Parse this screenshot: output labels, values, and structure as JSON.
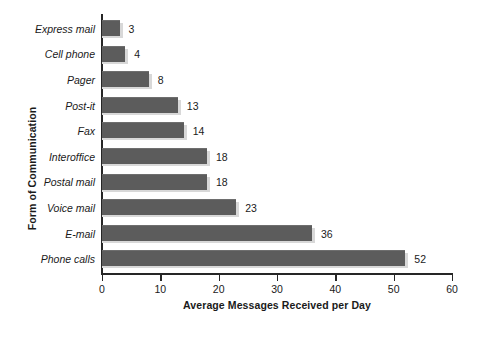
{
  "chart_data": {
    "type": "bar",
    "orientation": "horizontal",
    "title": "",
    "xlabel": "Average Messages Received per Day",
    "ylabel": "Form of Communication",
    "categories": [
      "Express mail",
      "Cell phone",
      "Pager",
      "Post-it",
      "Fax",
      "Interoffice",
      "Postal mail",
      "Voice mail",
      "E-mail",
      "Phone calls"
    ],
    "values": [
      3,
      4,
      8,
      13,
      14,
      18,
      18,
      23,
      36,
      52
    ],
    "data_labels": [
      "3",
      "4",
      "8",
      "13",
      "14",
      "18",
      "18",
      "23",
      "36",
      "52"
    ],
    "xlim": [
      0,
      60
    ],
    "xticks": [
      0,
      10,
      20,
      30,
      40,
      50,
      60
    ],
    "xtick_labels": [
      "0",
      "10",
      "20",
      "30",
      "40",
      "50",
      "60"
    ],
    "grid": false,
    "legend": false,
    "legend_position": "none",
    "bar_color": "#5c5c5c",
    "bar_shadow_color": "#d8d8d8",
    "axis_color": "#262626",
    "text_color": "#1a1a1a",
    "background_color": "#ffffff"
  }
}
